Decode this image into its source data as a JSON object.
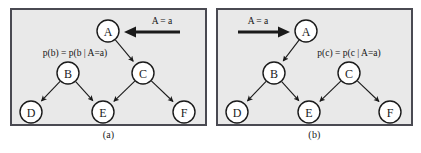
{
  "figure": {
    "panels": [
      {
        "caption": "(a)",
        "evidence_label": "A = a",
        "evidence_arrow_direction": "left",
        "probability_label": "p(b) = p(b | A=a)",
        "nodes": [
          {
            "id": "A",
            "label": "A",
            "x": 96,
            "y": 21
          },
          {
            "id": "B",
            "label": "B",
            "x": 56,
            "y": 63
          },
          {
            "id": "C",
            "label": "C",
            "x": 131,
            "y": 63
          },
          {
            "id": "D",
            "label": "D",
            "x": 19,
            "y": 102
          },
          {
            "id": "E",
            "label": "E",
            "x": 91,
            "y": 102
          },
          {
            "id": "F",
            "label": "F",
            "x": 172,
            "y": 102
          }
        ],
        "edges": [
          {
            "from": "A",
            "to": "C"
          },
          {
            "from": "B",
            "to": "D"
          },
          {
            "from": "B",
            "to": "E"
          },
          {
            "from": "C",
            "to": "E"
          },
          {
            "from": "C",
            "to": "F"
          }
        ]
      },
      {
        "caption": "(b)",
        "evidence_label": "A = a",
        "evidence_arrow_direction": "right",
        "probability_label": "p(c) = p(c | A=a)",
        "nodes": [
          {
            "id": "A",
            "label": "A",
            "x": 88,
            "y": 21
          },
          {
            "id": "B",
            "label": "B",
            "x": 56,
            "y": 63
          },
          {
            "id": "C",
            "label": "C",
            "x": 131,
            "y": 63
          },
          {
            "id": "D",
            "label": "D",
            "x": 19,
            "y": 102
          },
          {
            "id": "E",
            "label": "E",
            "x": 91,
            "y": 102
          },
          {
            "id": "F",
            "label": "F",
            "x": 172,
            "y": 102
          }
        ],
        "edges": [
          {
            "from": "A",
            "to": "B"
          },
          {
            "from": "B",
            "to": "D"
          },
          {
            "from": "B",
            "to": "E"
          },
          {
            "from": "C",
            "to": "E"
          },
          {
            "from": "C",
            "to": "F"
          }
        ]
      }
    ],
    "style": {
      "node_radius": 11,
      "node_fill": "#ffffff",
      "node_stroke": "#1a1a1a",
      "edge_color": "#1a1a1a",
      "panel_background": "#e9e9e9",
      "panel_border": "#4a4a52",
      "page_background": "#ffffff"
    }
  }
}
